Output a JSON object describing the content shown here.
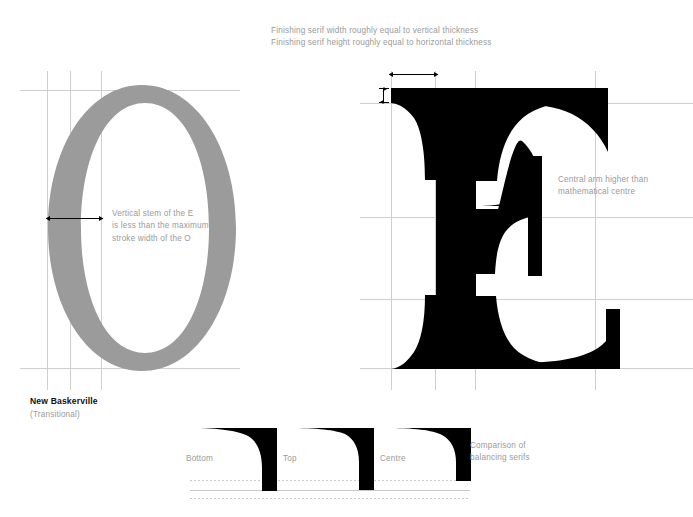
{
  "canvas": {
    "width": 693,
    "height": 517,
    "background": "#ffffff"
  },
  "palette": {
    "letter_o_fill": "#9b9b9b",
    "letter_e_fill": "#000000",
    "guide_line": "#cfcfcf",
    "guide_line_strong": "#bdbdbd",
    "annotation_text": "#9a9a9a",
    "title_text": "#111111",
    "arrow": "#000000",
    "dotted_reference": "#c9c9c9"
  },
  "annotations": {
    "finishing_serif": {
      "line1": "Finishing serif width roughly equal to vertical thickness",
      "line2": "Finishing serif height roughly equal to horizontal thickness"
    },
    "vertical_stem": {
      "line1": "Vertical stem of the E",
      "line2": "is less than the maximum",
      "line3": "stroke width of the O"
    },
    "central_arm": {
      "line1": "Central arm higher than",
      "line2": "mathematical centre"
    },
    "comparison": {
      "line1": "Comparison of",
      "line2": "balancing serifs"
    }
  },
  "typeface": {
    "name": "New Baskerville",
    "classification": "(Transitional)"
  },
  "specimen": {
    "letters": [
      "O",
      "E"
    ],
    "o_label": "O",
    "e_label": "E"
  },
  "serif_comparison": {
    "items": [
      {
        "label": "Bottom",
        "depth": "shallow"
      },
      {
        "label": "Top",
        "depth": "medium"
      },
      {
        "label": "Centre",
        "depth": "deep"
      }
    ]
  },
  "measures": {
    "serif_width_arrow": "horizontal double arrow",
    "serif_height_arrow": "vertical double arrow",
    "stroke_width_arrow": "horizontal double arrow"
  }
}
